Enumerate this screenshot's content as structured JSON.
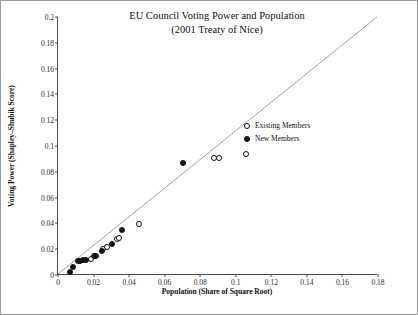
{
  "chart_data": {
    "type": "scatter",
    "title": "EU Council Voting Power and Population",
    "subtitle": "(2001 Treaty of  Nice)",
    "xlabel": "Population  (Share of Square Root)",
    "ylabel": "Voting Power  (Shapley–Shubik Score)",
    "xlim": [
      0,
      0.18
    ],
    "ylim": [
      0,
      0.2
    ],
    "xticks": [
      "0",
      "0.02",
      "0.04",
      "0.06",
      "0.08",
      "0.1",
      "0.12",
      "0.14",
      "0.16",
      "0.18"
    ],
    "xtickvals": [
      0,
      0.02,
      0.04,
      0.06,
      0.08,
      0.1,
      0.12,
      0.14,
      0.16,
      0.18
    ],
    "yticks": [
      "0",
      "0.02",
      "0.04",
      "0.06",
      "0.08",
      "0.1",
      "0.12",
      "0.14",
      "0.16",
      "0.18",
      "0.2"
    ],
    "ytickvals": [
      0,
      0.02,
      0.04,
      0.06,
      0.08,
      0.1,
      0.12,
      0.14,
      0.16,
      0.18,
      0.2
    ],
    "grid": false,
    "legend_position": "right-middle",
    "reference_line": {
      "from": [
        0,
        0
      ],
      "to": [
        0.18,
        0.2
      ],
      "color": "#8a8a8a"
    },
    "series": [
      {
        "name": "Existing Members",
        "marker": "open-circle",
        "color": "#ffffff",
        "edge_color": "#111111",
        "points": [
          [
            0.0185,
            0.0125
          ],
          [
            0.0205,
            0.0145
          ],
          [
            0.0215,
            0.015
          ],
          [
            0.0255,
            0.0205
          ],
          [
            0.0275,
            0.0215
          ],
          [
            0.033,
            0.028
          ],
          [
            0.0345,
            0.029
          ],
          [
            0.0455,
            0.0395
          ],
          [
            0.088,
            0.0905
          ],
          [
            0.0905,
            0.0905
          ],
          [
            0.1055,
            0.0935
          ]
        ]
      },
      {
        "name": "New Members",
        "marker": "filled-circle",
        "color": "#111111",
        "edge_color": "#111111",
        "points": [
          [
            0.007,
            0.002
          ],
          [
            0.0085,
            0.006
          ],
          [
            0.011,
            0.0105
          ],
          [
            0.0125,
            0.011
          ],
          [
            0.014,
            0.0115
          ],
          [
            0.016,
            0.012
          ],
          [
            0.021,
            0.015
          ],
          [
            0.0245,
            0.0185
          ],
          [
            0.0305,
            0.024
          ],
          [
            0.036,
            0.0345
          ],
          [
            0.0705,
            0.0865
          ]
        ]
      }
    ],
    "legend": [
      {
        "label": "Existing Members",
        "marker": "open-circle"
      },
      {
        "label": "New Members",
        "marker": "filled-circle"
      }
    ]
  }
}
